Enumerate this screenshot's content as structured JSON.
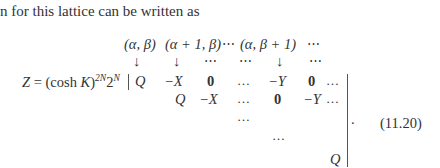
{
  "intro_text": "n for this lattice can be written as",
  "header": {
    "col1": "(α, β)",
    "col2": "(α + 1, β)",
    "dots1": "⋯",
    "col3": "(α, β + 1)",
    "dots2": "⋯"
  },
  "arrows": {
    "a1": "↓",
    "a2": "↓",
    "d1": "⋯",
    "d2": "⋯",
    "a3": "↓",
    "d3": "⋯"
  },
  "lhs": {
    "prefix": "Z = (cosh ",
    "K": "K",
    "close": ")",
    "exp1": "2N",
    "two": "2",
    "exp2": "N",
    "bar": "|"
  },
  "matrix": {
    "row1": [
      "Q",
      "−X",
      "0",
      "…",
      "−Y",
      "0",
      "…"
    ],
    "row2": [
      "Q",
      "−X",
      "…",
      "0",
      "−Y",
      "…"
    ],
    "row3": [
      "…"
    ],
    "row4": [
      "…"
    ],
    "row5": [
      "Q"
    ]
  },
  "period": ".",
  "equation_number": "(11.20)"
}
